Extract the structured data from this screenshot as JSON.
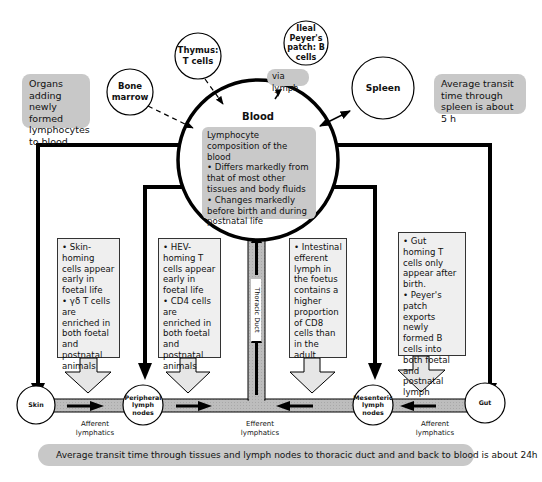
{
  "sources": {
    "organs_label": "Organs adding newly formed lymphocytes to blood",
    "bone_marrow": "Bone marrow",
    "thymus": "Thymus: T cells",
    "ileal_peyers_patch": "Ileal Peyer's patch: B cells",
    "via_lymph": "via lymph",
    "spleen": "Spleen",
    "spleen_transit": "Average transit time through spleen is about 5 h"
  },
  "blood": {
    "title": "Blood",
    "heading": "Lymphocyte composition of the blood",
    "bullet1": "• Differs markedly from that of most other tissues and body fluids",
    "bullet2": "• Changes markedly before birth and during postnatal life"
  },
  "notes": {
    "skin": "• Skin-homing cells appear early in foetal life\n• γδ T cells are enriched in both foetal and postnatal animals",
    "peripheral": "• HEV-homing T cells appear early in foetal life\n• CD4 cells are enriched in both foetal and postnatal animals",
    "intestinal": "• Intestinal efferent lymph in the foetus contains a higher proportion of CD8 cells than in the adult",
    "gut": "• Gut homing T cells only appear after birth.\n• Peyer's patch exports newly formed B cells into both foetal and postnatal lymph"
  },
  "thoracic_duct": "Thoracic Duct",
  "nodes": {
    "skin": "Skin",
    "peripheral": "Peripheral lymph nodes",
    "mesenteric": "Mesenteric lymph nodes",
    "gut": "Gut"
  },
  "lymphatics": {
    "afferent_left": "Afferent lymphatics",
    "efferent": "Efferent lymphatics",
    "afferent_right": "Afferent lymphatics"
  },
  "footer": "Average transit time through tissues and lymph nodes to thoracic duct and and back to blood is about 24h",
  "colors": {
    "grey_box": "#c8c8c8",
    "note_fill": "#efefef",
    "duct_fill": "#bdbdbd",
    "line": "#000000"
  }
}
